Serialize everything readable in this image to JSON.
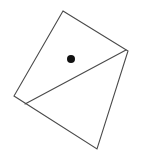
{
  "figure": {
    "background_color": "#ffffff",
    "stroke_color": "#4a4a4a",
    "stroke_width": 1.1,
    "dot_color": "#111111",
    "canvas": {
      "width": 144,
      "height": 159
    },
    "shapes": {
      "quadrilateral": {
        "name": "tilted-square",
        "points": "63,11 128,51 97,149 14,96",
        "fill": "none"
      },
      "diagonal": {
        "name": "interior-diagonal",
        "x1": 25,
        "y1": 104,
        "x2": 126,
        "y2": 50
      },
      "dot": {
        "name": "marked-point",
        "cx": 71,
        "cy": 59,
        "r": 4
      }
    }
  }
}
